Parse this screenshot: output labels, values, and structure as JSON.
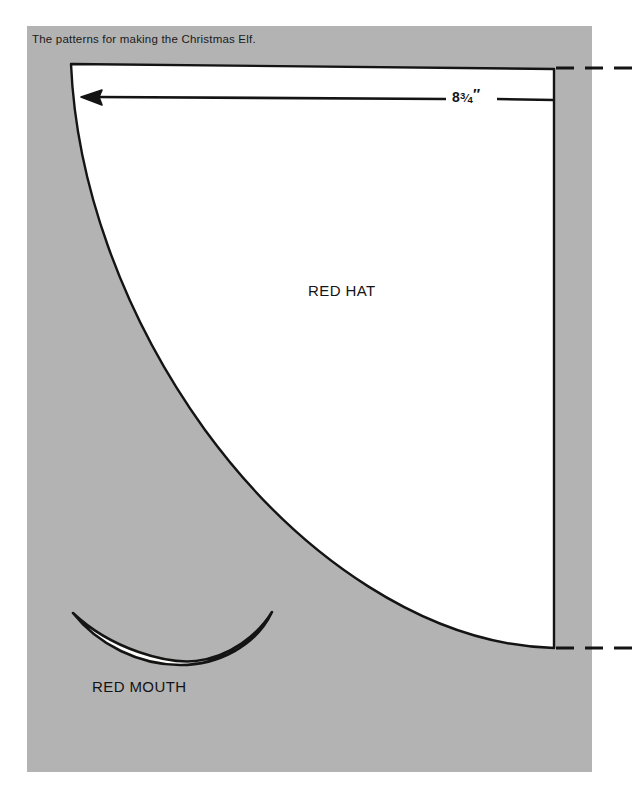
{
  "page": {
    "background_color": "#ffffff",
    "panel_color": "#b3b3b3",
    "shape_fill_color": "#ffffff",
    "line_color": "#141414"
  },
  "caption": {
    "text": "The patterns for making the Christmas Elf."
  },
  "pieces": [
    {
      "name": "red-hat",
      "label": "RED HAT"
    },
    {
      "name": "red-mouth",
      "label": "RED MOUTH"
    }
  ],
  "labels": {
    "red_hat": "RED HAT",
    "red_mouth": "RED MOUTH"
  },
  "dimension": {
    "whole": "8",
    "numerator": "3",
    "slash": "⁄",
    "denominator": "4",
    "unit": "″",
    "full_text": "8¾″"
  },
  "annotations": {
    "arrow_direction": "left",
    "dashed_guides": 2
  }
}
